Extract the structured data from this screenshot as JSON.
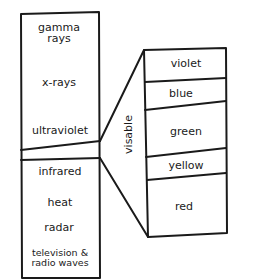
{
  "diagram": {
    "type": "electromagnetic-spectrum-sketch",
    "spectrum": {
      "bands": [
        {
          "label_line1": "gamma",
          "label_line2": "rays"
        },
        {
          "label": "x-rays"
        },
        {
          "label": "ultraviolet"
        },
        {
          "label": "infrared"
        },
        {
          "label": "heat"
        },
        {
          "label": "radar"
        },
        {
          "label_line1": "television &",
          "label_line2": "radio waves"
        }
      ]
    },
    "visible": {
      "label": "visable",
      "colors": [
        {
          "label": "violet"
        },
        {
          "label": "blue"
        },
        {
          "label": "green"
        },
        {
          "label": "yellow"
        },
        {
          "label": "red"
        }
      ]
    },
    "colors": {
      "ink": "#1a1a1a",
      "paper": "#ffffff"
    }
  }
}
